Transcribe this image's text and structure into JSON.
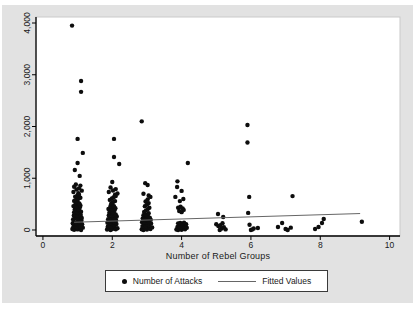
{
  "figure": {
    "xlabel": "Number of Rebel Groups",
    "legend": {
      "entries": [
        {
          "label": "Number of Attacks",
          "marker": "dot"
        },
        {
          "label": "Fitted Values",
          "marker": "line"
        }
      ]
    }
  },
  "colors": {
    "page_background": "#ffffff",
    "figure_background": "#e2e2e2",
    "plot_background": "#ffffff",
    "plot_border": "#c9c9c9",
    "axis": "#000000",
    "text": "#1a1a1a",
    "point": "#0d0d0d",
    "fitted_line": "#666666"
  },
  "chart_data": {
    "type": "scatter",
    "title": "",
    "xlabel": "Number of Rebel Groups",
    "ylabel": "",
    "xlim": [
      -0.2,
      10.3
    ],
    "ylim": [
      -116,
      4116
    ],
    "x_ticks": [
      0,
      2,
      4,
      6,
      8,
      10
    ],
    "y_ticks": [
      0,
      1000,
      2000,
      3000,
      4000
    ],
    "y_tick_labels": [
      "0",
      "1,000",
      "2,000",
      "3,000",
      "4,000"
    ],
    "grid": false,
    "legend_position": "bottom-center",
    "series": [
      {
        "name": "Number of Attacks",
        "type": "scatter",
        "marker": "filled-circle",
        "points": [
          [
            0.84,
            3950
          ],
          [
            1.1,
            2880
          ],
          [
            1.1,
            2670
          ],
          [
            1.0,
            1760
          ],
          [
            1.15,
            1490
          ],
          [
            1.0,
            1295
          ],
          [
            0.92,
            1160
          ],
          [
            1.06,
            1045
          ],
          [
            0.95,
            880
          ],
          [
            1.08,
            858
          ],
          [
            0.9,
            835
          ],
          [
            1.04,
            805
          ],
          [
            0.97,
            782
          ],
          [
            1.12,
            760
          ],
          [
            0.88,
            735
          ],
          [
            1.02,
            712
          ],
          [
            0.85,
            20
          ],
          [
            0.9,
            5
          ],
          [
            0.95,
            35
          ],
          [
            1.0,
            12
          ],
          [
            1.05,
            25
          ],
          [
            1.1,
            0
          ],
          [
            1.15,
            45
          ],
          [
            0.88,
            62
          ],
          [
            0.93,
            82
          ],
          [
            0.98,
            55
          ],
          [
            1.03,
            95
          ],
          [
            1.08,
            72
          ],
          [
            1.13,
            110
          ],
          [
            0.86,
            130
          ],
          [
            0.91,
            152
          ],
          [
            0.96,
            125
          ],
          [
            1.01,
            170
          ],
          [
            1.06,
            145
          ],
          [
            1.11,
            185
          ],
          [
            0.87,
            202
          ],
          [
            0.92,
            222
          ],
          [
            0.97,
            240
          ],
          [
            1.02,
            212
          ],
          [
            1.07,
            255
          ],
          [
            1.12,
            232
          ],
          [
            0.89,
            280
          ],
          [
            0.94,
            300
          ],
          [
            0.99,
            272
          ],
          [
            1.04,
            320
          ],
          [
            1.09,
            292
          ],
          [
            0.9,
            342
          ],
          [
            0.95,
            362
          ],
          [
            1.0,
            335
          ],
          [
            1.05,
            382
          ],
          [
            1.1,
            355
          ],
          [
            0.92,
            402
          ],
          [
            0.97,
            422
          ],
          [
            1.02,
            395
          ],
          [
            1.07,
            442
          ],
          [
            0.88,
            462
          ],
          [
            0.93,
            482
          ],
          [
            0.98,
            455
          ],
          [
            1.03,
            502
          ],
          [
            1.08,
            475
          ],
          [
            0.95,
            522
          ],
          [
            1.0,
            542
          ],
          [
            1.05,
            515
          ],
          [
            0.9,
            562
          ],
          [
            0.96,
            582
          ],
          [
            1.02,
            602
          ],
          [
            1.08,
            622
          ],
          [
            0.93,
            642
          ],
          [
            0.99,
            662
          ],
          [
            1.04,
            682
          ],
          [
            2.05,
            1760
          ],
          [
            2.05,
            1410
          ],
          [
            2.2,
            1275
          ],
          [
            2.0,
            928
          ],
          [
            1.95,
            820
          ],
          [
            2.1,
            790
          ],
          [
            2.02,
            762
          ],
          [
            1.9,
            735
          ],
          [
            2.15,
            705
          ],
          [
            2.08,
            680
          ],
          [
            1.85,
            10
          ],
          [
            1.9,
            30
          ],
          [
            1.95,
            0
          ],
          [
            2.0,
            20
          ],
          [
            2.05,
            45
          ],
          [
            2.1,
            15
          ],
          [
            2.15,
            35
          ],
          [
            1.87,
            65
          ],
          [
            1.92,
            85
          ],
          [
            1.97,
            60
          ],
          [
            2.02,
            100
          ],
          [
            2.07,
            80
          ],
          [
            2.12,
            115
          ],
          [
            1.86,
            140
          ],
          [
            1.91,
            160
          ],
          [
            1.96,
            135
          ],
          [
            2.01,
            175
          ],
          [
            2.06,
            150
          ],
          [
            2.11,
            190
          ],
          [
            1.88,
            210
          ],
          [
            1.93,
            230
          ],
          [
            1.98,
            205
          ],
          [
            2.03,
            245
          ],
          [
            2.08,
            225
          ],
          [
            2.13,
            262
          ],
          [
            1.9,
            285
          ],
          [
            1.95,
            305
          ],
          [
            2.0,
            280
          ],
          [
            2.05,
            325
          ],
          [
            2.1,
            300
          ],
          [
            1.92,
            345
          ],
          [
            1.97,
            365
          ],
          [
            2.02,
            340
          ],
          [
            2.07,
            385
          ],
          [
            1.89,
            405
          ],
          [
            1.94,
            425
          ],
          [
            1.99,
            400
          ],
          [
            2.04,
            445
          ],
          [
            2.09,
            420
          ],
          [
            1.95,
            465
          ],
          [
            2.0,
            485
          ],
          [
            2.05,
            460
          ],
          [
            1.97,
            510
          ],
          [
            2.02,
            535
          ],
          [
            2.08,
            558
          ],
          [
            1.93,
            582
          ],
          [
            1.99,
            608
          ],
          [
            2.04,
            632
          ],
          [
            2.1,
            655
          ],
          [
            2.85,
            2100
          ],
          [
            2.95,
            905
          ],
          [
            3.02,
            870
          ],
          [
            2.9,
            700
          ],
          [
            3.05,
            668
          ],
          [
            3.1,
            640
          ],
          [
            2.85,
            15
          ],
          [
            2.9,
            0
          ],
          [
            2.95,
            30
          ],
          [
            3.0,
            10
          ],
          [
            3.05,
            40
          ],
          [
            3.1,
            20
          ],
          [
            3.15,
            50
          ],
          [
            2.87,
            75
          ],
          [
            2.92,
            95
          ],
          [
            2.97,
            70
          ],
          [
            3.02,
            110
          ],
          [
            3.07,
            85
          ],
          [
            3.12,
            125
          ],
          [
            2.86,
            150
          ],
          [
            2.91,
            170
          ],
          [
            2.96,
            145
          ],
          [
            3.01,
            185
          ],
          [
            3.06,
            160
          ],
          [
            3.11,
            200
          ],
          [
            2.88,
            225
          ],
          [
            2.93,
            245
          ],
          [
            2.98,
            220
          ],
          [
            3.03,
            262
          ],
          [
            3.08,
            240
          ],
          [
            2.9,
            285
          ],
          [
            2.95,
            305
          ],
          [
            3.0,
            280
          ],
          [
            3.05,
            325
          ],
          [
            2.92,
            350
          ],
          [
            2.97,
            375
          ],
          [
            3.02,
            400
          ],
          [
            3.07,
            430
          ],
          [
            2.94,
            460
          ],
          [
            3.0,
            490
          ],
          [
            3.05,
            520
          ],
          [
            2.96,
            552
          ],
          [
            3.02,
            588
          ],
          [
            4.18,
            1295
          ],
          [
            3.88,
            940
          ],
          [
            3.87,
            830
          ],
          [
            4.0,
            756
          ],
          [
            3.82,
            640
          ],
          [
            4.05,
            600
          ],
          [
            3.95,
            558
          ],
          [
            3.9,
            430
          ],
          [
            3.97,
            448
          ],
          [
            4.03,
            418
          ],
          [
            3.93,
            368
          ],
          [
            4.0,
            345
          ],
          [
            4.06,
            388
          ],
          [
            3.85,
            10
          ],
          [
            3.9,
            0
          ],
          [
            3.95,
            25
          ],
          [
            4.0,
            5
          ],
          [
            4.05,
            30
          ],
          [
            4.1,
            15
          ],
          [
            4.15,
            42
          ],
          [
            3.88,
            60
          ],
          [
            3.93,
            82
          ],
          [
            3.98,
            55
          ],
          [
            4.03,
            95
          ],
          [
            4.08,
            70
          ],
          [
            4.13,
            112
          ],
          [
            3.9,
            128
          ],
          [
            3.96,
            138
          ],
          [
            4.02,
            120
          ],
          [
            4.07,
            142
          ],
          [
            5.05,
            310
          ],
          [
            5.2,
            252
          ],
          [
            5.0,
            112
          ],
          [
            5.06,
            75
          ],
          [
            5.12,
            95
          ],
          [
            5.16,
            30
          ],
          [
            5.22,
            55
          ],
          [
            5.27,
            12
          ],
          [
            5.1,
            0
          ],
          [
            5.18,
            132
          ],
          [
            5.9,
            2030
          ],
          [
            5.9,
            1690
          ],
          [
            5.95,
            640
          ],
          [
            5.92,
            330
          ],
          [
            5.96,
            100
          ],
          [
            6.0,
            0
          ],
          [
            6.08,
            28
          ],
          [
            6.2,
            40
          ],
          [
            6.04,
            12
          ],
          [
            7.2,
            655
          ],
          [
            6.78,
            58
          ],
          [
            6.9,
            135
          ],
          [
            7.0,
            20
          ],
          [
            7.06,
            0
          ],
          [
            7.15,
            45
          ],
          [
            7.85,
            20
          ],
          [
            7.95,
            58
          ],
          [
            8.05,
            135
          ],
          [
            8.1,
            212
          ],
          [
            9.2,
            160
          ]
        ]
      },
      {
        "name": "Fitted Values",
        "type": "line",
        "points": [
          [
            0.9,
            150
          ],
          [
            9.15,
            318
          ]
        ]
      }
    ]
  }
}
